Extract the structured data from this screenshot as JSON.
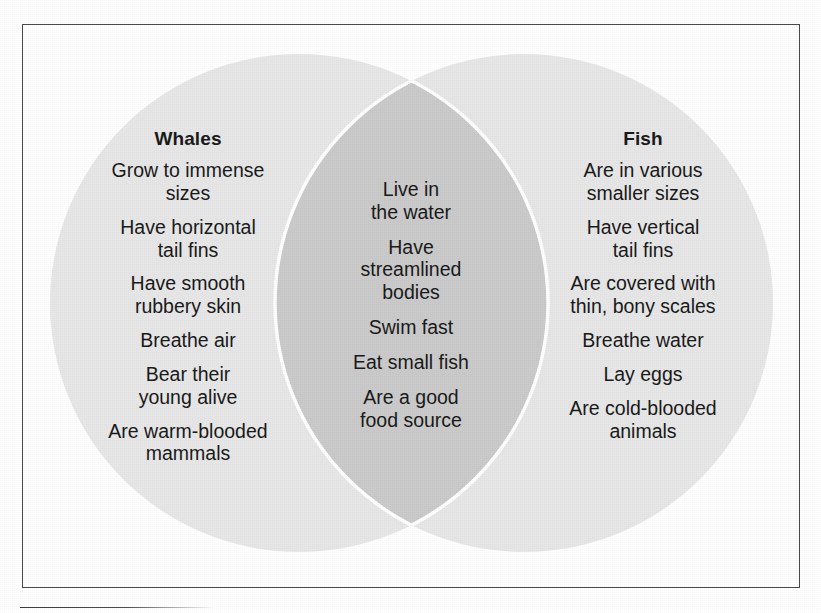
{
  "diagram": {
    "type": "venn",
    "colors": {
      "circle_fill": "#e7e7e7",
      "overlap_fill": "#cccccc",
      "separator_stroke": "#ffffff",
      "frame_border": "#4a4a4a",
      "background": "#ffffff",
      "text": "#1a1a1a"
    },
    "left": {
      "heading": "Whales",
      "items": [
        "Grow to immense\nsizes",
        "Have horizontal\ntail fins",
        "Have smooth\nrubbery skin",
        "Breathe air",
        "Bear their\nyoung alive",
        "Are warm-blooded\nmammals"
      ]
    },
    "center": {
      "heading": "",
      "items": [
        "Live in\nthe water",
        "Have\nstreamlined\nbodies",
        "Swim fast",
        "Eat small fish",
        "Are a good\nfood source"
      ]
    },
    "right": {
      "heading": "Fish",
      "items": [
        "Are in various\nsmaller sizes",
        "Have vertical\ntail fins",
        "Are covered with\nthin, bony scales",
        "Breathe water",
        "Lay eggs",
        "Are cold-blooded\nanimals"
      ]
    }
  }
}
